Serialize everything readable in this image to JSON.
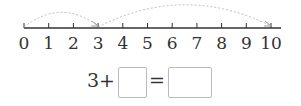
{
  "number_line": {
    "min": 0,
    "max": 10,
    "tick_labels": [
      "0",
      "1",
      "2",
      "3",
      "4",
      "5",
      "6",
      "7",
      "8",
      "9",
      "10"
    ],
    "jumps": [
      {
        "from": 0,
        "to": 3
      },
      {
        "from": 3,
        "to": 10
      }
    ],
    "line_color": "#333333",
    "arc_color": "#bbbbbb"
  },
  "equation": {
    "first_addend": "3",
    "plus": "+",
    "equals": "=",
    "blank1": "",
    "blank2": ""
  }
}
